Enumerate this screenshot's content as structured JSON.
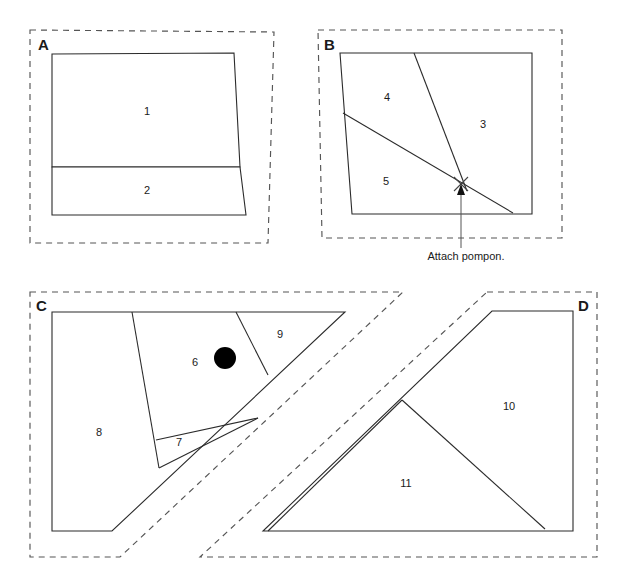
{
  "document": {
    "title": "Pattern Pieces Layout",
    "background_color": "#ffffff",
    "width": 627,
    "height": 579
  },
  "style": {
    "cut_line_color": "#555555",
    "piece_line_color": "#2b2b2b",
    "text_color": "#1a1a1a",
    "marker_color": "#000000"
  },
  "panels": [
    {
      "id": "panel-a",
      "letter": "A",
      "letter_x": 38,
      "letter_y": 50,
      "pieces": [
        {
          "number": "1",
          "x": 147,
          "y": 115
        },
        {
          "number": "2",
          "x": 147,
          "y": 194
        }
      ]
    },
    {
      "id": "panel-b",
      "letter": "B",
      "letter_x": 324,
      "letter_y": 50,
      "pieces": [
        {
          "number": "3",
          "x": 483,
          "y": 128
        },
        {
          "number": "4",
          "x": 387,
          "y": 101
        },
        {
          "number": "5",
          "x": 386,
          "y": 185
        }
      ]
    },
    {
      "id": "panel-c",
      "letter": "C",
      "letter_x": 36,
      "letter_y": 311,
      "pieces": [
        {
          "number": "6",
          "x": 195,
          "y": 366
        },
        {
          "number": "7",
          "x": 179,
          "y": 446
        },
        {
          "number": "8",
          "x": 99,
          "y": 436
        },
        {
          "number": "9",
          "x": 280,
          "y": 338
        }
      ]
    },
    {
      "id": "panel-d",
      "letter": "D",
      "letter_x": 578,
      "letter_y": 311,
      "pieces": [
        {
          "number": "10",
          "x": 509,
          "y": 410
        },
        {
          "number": "11",
          "x": 406,
          "y": 487
        }
      ]
    }
  ],
  "annotations": [
    {
      "id": "attach-pompon",
      "text": "Attach pompon.",
      "text_x": 466,
      "text_y": 260,
      "target_x": 461,
      "target_y": 187
    }
  ],
  "markers": [
    {
      "id": "pompon-dot",
      "type": "filled-circle",
      "panel": "panel-c",
      "x": 225,
      "y": 358,
      "r": 11
    },
    {
      "id": "pompon-x-mark",
      "type": "x-cross",
      "panel": "panel-b",
      "x": 461,
      "y": 184,
      "size": 7
    }
  ]
}
